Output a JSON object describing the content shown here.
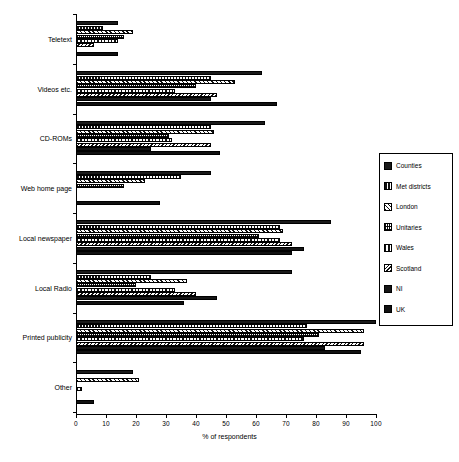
{
  "chart_data": {
    "type": "bar",
    "orientation": "horizontal",
    "title": "",
    "xlabel": "% of respondents",
    "ylabel": "",
    "xlim": [
      0,
      100
    ],
    "xticks": [
      0,
      10,
      20,
      30,
      40,
      50,
      60,
      70,
      80,
      90,
      100
    ],
    "grid": false,
    "legend_position": "right",
    "categories": [
      "Teletext",
      "Videos etc.",
      "CD-ROMs",
      "Web home page",
      "Local newspaper",
      "Local Radio",
      "Printed publicity",
      "Other"
    ],
    "series": [
      {
        "name": "Counties",
        "values": [
          14,
          62,
          63,
          45,
          85,
          72,
          100,
          19
        ]
      },
      {
        "name": "Met districts",
        "values": [
          9,
          45,
          45,
          35,
          68,
          25,
          77,
          0
        ]
      },
      {
        "name": "London",
        "values": [
          19,
          53,
          46,
          23,
          69,
          37,
          96,
          21
        ]
      },
      {
        "name": "Unitaries",
        "values": [
          16,
          40,
          31,
          16,
          61,
          20,
          81,
          0
        ]
      },
      {
        "name": "Wales",
        "values": [
          14,
          33,
          32,
          0,
          68,
          33,
          76,
          2
        ]
      },
      {
        "name": "Scotland",
        "values": [
          6,
          47,
          45,
          0,
          72,
          40,
          96,
          0
        ]
      },
      {
        "name": "NI",
        "values": [
          0,
          45,
          25,
          0,
          76,
          47,
          83,
          0
        ]
      },
      {
        "name": "UK",
        "values": [
          14,
          67,
          48,
          28,
          72,
          36,
          95,
          6
        ]
      }
    ]
  }
}
